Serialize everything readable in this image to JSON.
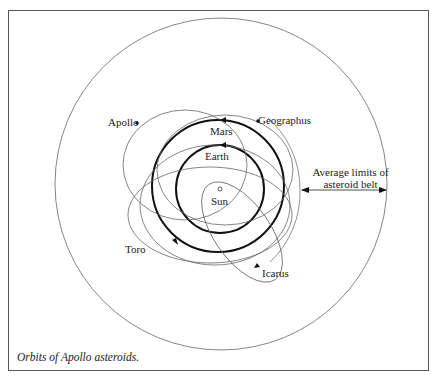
{
  "figure": {
    "caption": "Orbits of Apollo asteroids.",
    "colors": {
      "line": "#555555",
      "thick_line": "#111111",
      "frame": "#555555",
      "text": "#222222"
    }
  },
  "labels": {
    "apollo": "Apollo",
    "geographus": "Geographus",
    "mars": "Mars",
    "earth": "Earth",
    "sun": "Sun",
    "toro": "Toro",
    "icarus": "Icarus",
    "belt_line1": "Average limits of",
    "belt_line2": "asteroid belt"
  }
}
